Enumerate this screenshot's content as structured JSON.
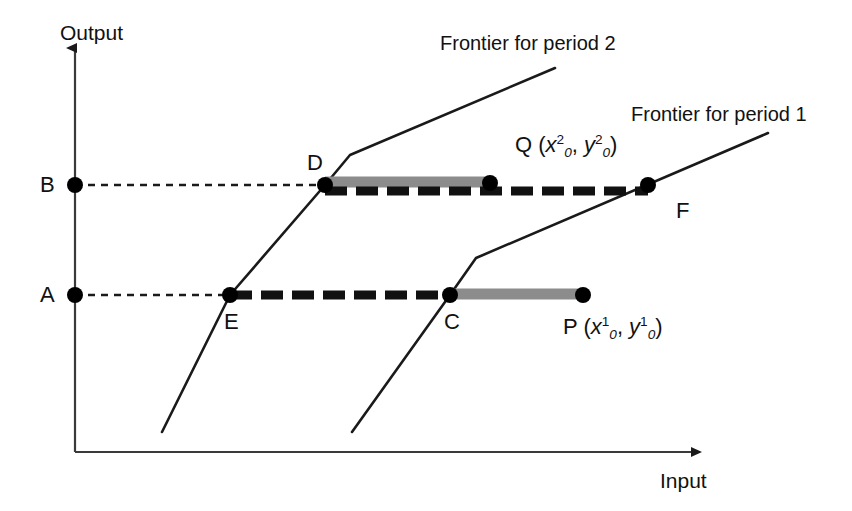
{
  "figure": {
    "width": 852,
    "height": 511,
    "background": "#ffffff",
    "line_color": "#1a1a1a",
    "gray_bar_color": "#8c8c8c",
    "dot_color": "#000000"
  },
  "axes": {
    "y_label": "Output",
    "x_label": "Input",
    "origin": {
      "x": 75,
      "y": 452
    },
    "y_tip": {
      "x": 75,
      "y": 48
    },
    "x_tip": {
      "x": 700,
      "y": 452
    }
  },
  "level_ticks": [
    {
      "name": "B",
      "label": "B",
      "x": 75,
      "y": 185
    },
    {
      "name": "A",
      "label": "A",
      "x": 75,
      "y": 295
    }
  ],
  "frontiers": [
    {
      "id": "period2",
      "label": "Frontier for period 2",
      "label_x": 440,
      "label_y": 33,
      "points": [
        [
          162,
          432
        ],
        [
          230,
          295
        ],
        [
          325,
          185
        ],
        [
          350,
          155
        ],
        [
          555,
          68
        ]
      ]
    },
    {
      "id": "period1",
      "label": "Frontier for period 1",
      "label_x": 631,
      "label_y": 104,
      "points": [
        [
          352,
          432
        ],
        [
          450,
          295
        ],
        [
          476,
          258
        ],
        [
          768,
          133
        ]
      ]
    }
  ],
  "points": [
    {
      "id": "D",
      "label": "D",
      "x": 325,
      "y": 185,
      "label_x": 307,
      "label_y": 152
    },
    {
      "id": "Q",
      "label": "Q",
      "x": 490,
      "y": 183,
      "label_x": 515,
      "label_y": 134
    },
    {
      "id": "F",
      "label": "F",
      "x": 648,
      "y": 185,
      "label_x": 676,
      "label_y": 200
    },
    {
      "id": "E",
      "label": "E",
      "x": 230,
      "y": 295,
      "label_x": 224,
      "label_y": 311
    },
    {
      "id": "C",
      "label": "C",
      "x": 450,
      "y": 295,
      "label_x": 444,
      "label_y": 311
    },
    {
      "id": "P",
      "label": "P",
      "x": 583,
      "y": 295,
      "label_x": 563,
      "label_y": 316
    }
  ],
  "coordinate_labels": [
    {
      "id": "Q-coords",
      "point": "Q",
      "text": "Q (x²₀, y²₀)",
      "prefix": "Q (",
      "var1": "x",
      "sup1": "2",
      "sub1": "0",
      "separator": ", ",
      "var2": "y",
      "sup2": "2",
      "sub2": "0",
      "suffix": ")",
      "x": 515,
      "y": 134
    },
    {
      "id": "P-coords",
      "point": "P",
      "text": "P (x¹₀, y¹₀)",
      "prefix": "P (",
      "var1": "x",
      "sup1": "1",
      "sub1": "0",
      "separator": ", ",
      "var2": "y",
      "sup2": "1",
      "sub2": "0",
      "suffix": ")",
      "x": 563,
      "y": 316
    }
  ],
  "measure_bars": [
    {
      "id": "gray-bar-DQ",
      "style": "gray",
      "from_point": "D",
      "to_point": "Q",
      "x1": 325,
      "x2": 490,
      "y": 182,
      "thickness": 11,
      "color": "#8c8c8c"
    },
    {
      "id": "gray-bar-CP",
      "style": "gray",
      "from_point": "C",
      "to_point": "P",
      "x1": 450,
      "x2": 583,
      "y": 294,
      "thickness": 11,
      "color": "#8c8c8c"
    },
    {
      "id": "dashed-bar-DF",
      "style": "thick-dashed",
      "from_point": "D",
      "to_point": "F",
      "x1": 325,
      "x2": 648,
      "y": 191,
      "thickness": 9,
      "color": "#111111"
    },
    {
      "id": "dashed-bar-EC",
      "style": "thick-dashed",
      "from_point": "E",
      "to_point": "C",
      "x1": 230,
      "x2": 450,
      "y": 295,
      "thickness": 9,
      "color": "#111111"
    }
  ],
  "guide_lines": [
    {
      "id": "guide-B-D",
      "from_point": "B",
      "to_point": "D",
      "x1": 75,
      "x2": 325,
      "y": 185
    },
    {
      "id": "guide-A-E",
      "from_point": "A",
      "to_point": "E",
      "x1": 75,
      "x2": 230,
      "y": 295
    }
  ]
}
